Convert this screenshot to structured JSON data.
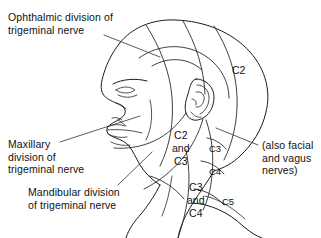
{
  "figure": {
    "background_color": "#ffffff",
    "line_color": "#1b1b1b",
    "text_color": "#111111"
  },
  "callout_labels": {
    "ophthalmic": "Ophthalmic division of\ntrigeminal nerve",
    "maxillary": "Maxillary\ndivision of\ntrigeminal nerve",
    "mandibular": "Mandibular division\nof trigeminal nerve",
    "also_nerves": "(also facial\nand vagus\nnerves)"
  },
  "dermatome_labels": {
    "c2": "C2",
    "c2_and_c3": "C2\nand\nC3",
    "c3_band": "C3",
    "c4_band": "C4",
    "c3_and_c4": "C3\nand\nC4",
    "c5": "C5"
  },
  "anatomy_parts": [
    "head-outline",
    "face-profile",
    "nose",
    "lips",
    "chin",
    "eye",
    "ear",
    "neck",
    "shoulder"
  ]
}
